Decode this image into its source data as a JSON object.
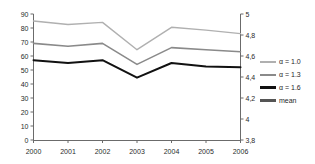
{
  "chart_data": {
    "type": "line",
    "title": "",
    "subtitle": "",
    "xlabel": "",
    "ylabel": "",
    "categories": [
      "2000",
      "2001",
      "2002",
      "2003",
      "2004",
      "2005",
      "2006"
    ],
    "x": [
      2000,
      2001,
      2002,
      2003,
      2004,
      2005,
      2006
    ],
    "grid": false,
    "legend_position": "right",
    "axes": {
      "left": {
        "ylim": [
          0,
          90
        ],
        "ticks": [
          0,
          10,
          20,
          30,
          40,
          50,
          60,
          70,
          80,
          90
        ],
        "tick_labels": [
          "0",
          "10",
          "20",
          "30",
          "40",
          "50",
          "60",
          "70",
          "80",
          "90"
        ]
      },
      "right": {
        "ylim": [
          3.8,
          5.0
        ],
        "ticks": [
          3.8,
          4.0,
          4.2,
          4.4,
          4.6,
          4.8,
          5.0
        ],
        "tick_labels": [
          "3,8",
          "4",
          "4,2",
          "4,4",
          "4,6",
          "4,8",
          "5"
        ]
      },
      "x": {
        "tick_labels": [
          "2000",
          "2001",
          "2002",
          "2003",
          "2004",
          "2005",
          "2006"
        ]
      }
    },
    "series": [
      {
        "name": "α = 1.0",
        "axis": "left",
        "color": "#b0b0b0",
        "width": 1.4,
        "values": [
          85,
          82.5,
          84,
          64.5,
          80.5,
          78.5,
          76
        ]
      },
      {
        "name": "α = 1.3",
        "axis": "left",
        "color": "#8a8a8a",
        "width": 1.6,
        "values": [
          69,
          67,
          69,
          54,
          66,
          64.5,
          63
        ]
      },
      {
        "name": "α = 1.6",
        "axis": "left",
        "color": "#111111",
        "width": 2.0,
        "values": [
          57,
          55,
          57,
          44.5,
          55,
          52.5,
          52
        ]
      },
      {
        "name": "mean",
        "axis": "right",
        "color": "#555555",
        "width": 2.2,
        "values": [
          32.5,
          36.5,
          33,
          27.5,
          17,
          17,
          10.5
        ]
      }
    ]
  },
  "legend": {
    "items": [
      {
        "label": "α = 1.0",
        "color": "#b0b0b0"
      },
      {
        "label": "α = 1.3",
        "color": "#8a8a8a"
      },
      {
        "label": "α = 1.6",
        "color": "#111111"
      },
      {
        "label": "mean",
        "color": "#555555"
      }
    ]
  }
}
